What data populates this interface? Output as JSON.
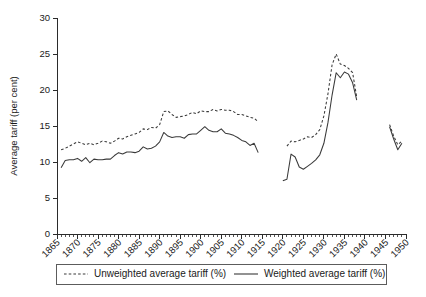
{
  "chart_data": {
    "type": "line",
    "title": "",
    "xlabel": "",
    "ylabel": "Average tariff (per cent)",
    "xlim": [
      1865,
      1950
    ],
    "ylim": [
      0,
      30
    ],
    "yticks": [
      0,
      5,
      10,
      15,
      20,
      25,
      30
    ],
    "xticks": [
      1865,
      1870,
      1875,
      1880,
      1885,
      1890,
      1895,
      1900,
      1905,
      1910,
      1915,
      1920,
      1925,
      1930,
      1935,
      1940,
      1945,
      1950
    ],
    "xtick_labels": [
      "1865",
      "1870",
      "1875",
      "1880",
      "1885",
      "1890",
      "1895",
      "1900",
      "1905",
      "1910",
      "1915",
      "1920",
      "1925",
      "1930",
      "1935",
      "1940",
      "1945",
      "1950"
    ],
    "ytick_labels": [
      "0",
      "5",
      "10",
      "15",
      "20",
      "25",
      "30"
    ],
    "minor_tick_interval": 1,
    "grid": false,
    "legend_position": "below-axes",
    "series": [
      {
        "name": "Unweighted average tariff (%)",
        "style": "dashed",
        "color": "#3a3a3a",
        "segments": [
          {
            "x": [
              1866,
              1867,
              1868,
              1869,
              1870,
              1871,
              1872,
              1873,
              1874,
              1875,
              1876,
              1877,
              1878,
              1879,
              1880,
              1881,
              1882,
              1883,
              1884,
              1885,
              1886,
              1887,
              1888,
              1889,
              1890,
              1891,
              1892,
              1893,
              1894,
              1895,
              1896,
              1897,
              1898,
              1899,
              1900,
              1901,
              1902,
              1903,
              1904,
              1905,
              1906,
              1907,
              1908,
              1909,
              1910,
              1911,
              1912,
              1913,
              1914
            ],
            "y": [
              11.7,
              11.9,
              12.2,
              12.5,
              12.8,
              12.6,
              12.4,
              12.6,
              12.4,
              12.6,
              12.9,
              12.8,
              12.6,
              12.9,
              13.3,
              13.2,
              13.5,
              13.7,
              13.9,
              14.1,
              14.6,
              14.5,
              14.8,
              14.7,
              15.2,
              17.0,
              17.1,
              16.6,
              16.2,
              16.3,
              16.4,
              16.6,
              16.9,
              16.7,
              17.1,
              17.0,
              17.0,
              17.3,
              17.1,
              17.3,
              17.2,
              17.2,
              17.0,
              16.6,
              16.6,
              16.4,
              16.2,
              16.1,
              15.6
            ]
          },
          {
            "x": [
              1921,
              1922,
              1923,
              1924,
              1925,
              1926,
              1927,
              1928,
              1929,
              1930,
              1931,
              1932,
              1933,
              1934,
              1935,
              1936,
              1937,
              1938
            ],
            "y": [
              12.2,
              12.9,
              12.8,
              13.0,
              13.2,
              13.5,
              13.4,
              13.8,
              14.5,
              16.4,
              19.5,
              23.5,
              25.0,
              23.6,
              23.4,
              23.0,
              22.4,
              19.0
            ]
          },
          {
            "x": [
              1946,
              1947,
              1948,
              1949
            ],
            "y": [
              15.2,
              13.6,
              12.4,
              12.9
            ]
          }
        ]
      },
      {
        "name": "Weighted average tariff (%)",
        "style": "solid",
        "color": "#3a3a3a",
        "segments": [
          {
            "x": [
              1866,
              1867,
              1868,
              1869,
              1870,
              1871,
              1872,
              1873,
              1874,
              1875,
              1876,
              1877,
              1878,
              1879,
              1880,
              1881,
              1882,
              1883,
              1884,
              1885,
              1886,
              1887,
              1888,
              1889,
              1890,
              1891,
              1892,
              1893,
              1894,
              1895,
              1896,
              1897,
              1898,
              1899,
              1900,
              1901,
              1902,
              1903,
              1904,
              1905,
              1906,
              1907,
              1908,
              1909,
              1910,
              1911,
              1912,
              1913,
              1914
            ],
            "y": [
              9.2,
              10.2,
              10.3,
              10.3,
              10.5,
              10.1,
              10.6,
              9.9,
              10.4,
              10.3,
              10.3,
              10.4,
              10.4,
              10.9,
              11.3,
              11.1,
              11.4,
              11.4,
              11.3,
              11.5,
              12.1,
              11.8,
              11.9,
              12.2,
              12.8,
              14.1,
              13.6,
              13.4,
              13.5,
              13.5,
              13.3,
              13.8,
              13.9,
              13.9,
              14.4,
              14.9,
              14.4,
              14.2,
              14.2,
              14.6,
              14.0,
              13.9,
              13.7,
              13.4,
              13.0,
              12.8,
              12.3,
              12.6,
              11.3
            ]
          },
          {
            "x": [
              1920,
              1921,
              1922,
              1923,
              1924,
              1925,
              1926,
              1927,
              1928,
              1929,
              1930,
              1931,
              1932,
              1933,
              1934,
              1935,
              1936,
              1937,
              1938
            ],
            "y": [
              7.4,
              7.6,
              11.1,
              10.7,
              9.3,
              9.0,
              9.4,
              9.8,
              10.3,
              11.0,
              12.6,
              15.5,
              19.3,
              22.4,
              21.7,
              22.5,
              22.2,
              21.0,
              18.6
            ]
          },
          {
            "x": [
              1946,
              1947,
              1948,
              1949
            ],
            "y": [
              14.9,
              13.2,
              11.7,
              12.6
            ]
          }
        ]
      }
    ]
  },
  "legend": {
    "items": [
      {
        "label": "Unweighted average tariff (%)",
        "style": "dashed"
      },
      {
        "label": "Weighted average tariff (%)",
        "style": "solid"
      }
    ]
  }
}
